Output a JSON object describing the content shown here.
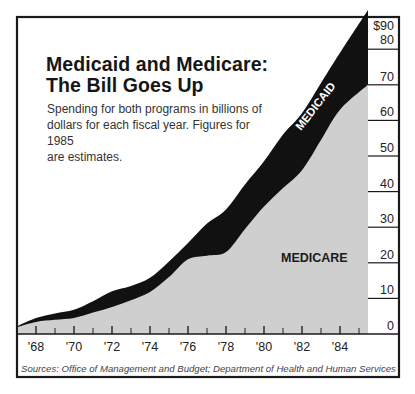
{
  "title_lines": [
    "Medicaid and Medicare:",
    "The Bill Goes Up"
  ],
  "subtitle_lines": [
    "Spending for both programs in billions of",
    "dollars for each fiscal year. Figures for 1985",
    "are estimates."
  ],
  "source": "Sources: Office of Management and Budget; Department of Health and Human Services",
  "colors": {
    "medicare": "#cfcfcf",
    "medicaid": "#111111",
    "frame": "#1a1a1a",
    "background": "#ffffff"
  },
  "chart_data": {
    "type": "area",
    "stacked": true,
    "title": "Medicaid and Medicare: The Bill Goes Up",
    "subtitle": "Spending for both programs in billions of dollars for each fiscal year. Figures for 1985 are estimates.",
    "xlabel": "",
    "ylabel": "",
    "x": [
      1967,
      1968,
      1969,
      1970,
      1971,
      1972,
      1973,
      1974,
      1975,
      1976,
      1977,
      1978,
      1979,
      1980,
      1981,
      1982,
      1983,
      1984,
      1985
    ],
    "x_tick_labels": [
      "'68",
      "'70",
      "'72",
      "'74",
      "'76",
      "'78",
      "'80",
      "'82",
      "'84"
    ],
    "y_tick_labels": [
      "0",
      "10",
      "20",
      "30",
      "40",
      "50",
      "60",
      "70",
      "80",
      "$90"
    ],
    "ylim": [
      0,
      90
    ],
    "grid": false,
    "legend": "inline labels",
    "series": [
      {
        "name": "MEDICARE",
        "values": [
          2.0,
          3.4,
          4.0,
          4.5,
          6.0,
          7.6,
          9.5,
          11.8,
          16.0,
          21.0,
          22.0,
          23.0,
          29.5,
          35.8,
          41.0,
          46.0,
          54.5,
          63.0,
          70.0
        ]
      },
      {
        "name": "MEDICAID",
        "values": [
          0.3,
          1.1,
          1.8,
          2.3,
          3.2,
          4.4,
          4.0,
          4.0,
          4.4,
          4.6,
          9.0,
          12.0,
          12.5,
          12.7,
          15.0,
          16.0,
          16.0,
          16.0,
          21.0
        ]
      }
    ],
    "totals": [
      2.3,
      4.5,
      5.8,
      6.8,
      9.2,
      12.0,
      13.5,
      15.8,
      20.4,
      25.6,
      31.0,
      35.0,
      42.0,
      48.5,
      56.0,
      62.0,
      70.5,
      79.0,
      91.0
    ],
    "annotations": [
      "MEDICAID",
      "MEDICARE"
    ]
  }
}
